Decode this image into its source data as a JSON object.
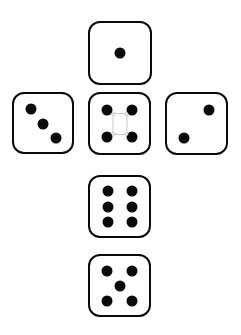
{
  "figure": {
    "background_color": "#ffffff",
    "die_face_color": "#ffffff",
    "die_border_color": "#0a0a0a",
    "pip_color": "#0a0a0a",
    "artifact_color": "#c9c9c9"
  },
  "chart_data": {
    "type": "diagram",
    "layout": "cross",
    "canvas": {
      "width": 241,
      "height": 335
    },
    "dice": [
      {
        "name": "top-die",
        "value": 1,
        "position": "top",
        "x": 88,
        "y": 21,
        "size": 64,
        "pip_layout": [
          "center"
        ],
        "pips": [
          {
            "cx": 50,
            "cy": 50
          }
        ]
      },
      {
        "name": "left-die",
        "value": 3,
        "position": "left",
        "x": 12,
        "y": 92,
        "size": 62,
        "pip_layout": [
          "top-left",
          "center",
          "bottom-right"
        ],
        "pips": [
          {
            "cx": 29,
            "cy": 26
          },
          {
            "cx": 50,
            "cy": 52
          },
          {
            "cx": 73,
            "cy": 76
          }
        ]
      },
      {
        "name": "center-die",
        "value": 4,
        "position": "center",
        "x": 88,
        "y": 92,
        "size": 63,
        "pip_layout": [
          "top-left",
          "top-right",
          "bottom-left",
          "bottom-right"
        ],
        "pips": [
          {
            "cx": 29,
            "cy": 27
          },
          {
            "cx": 72,
            "cy": 27
          },
          {
            "cx": 29,
            "cy": 73
          },
          {
            "cx": 72,
            "cy": 73
          }
        ],
        "artifact": {
          "name": "selection-box",
          "cx": 50,
          "cy": 50,
          "width": 15,
          "height": 22,
          "handles": [
            "top-left",
            "top-right",
            "bottom-left",
            "bottom-right"
          ]
        }
      },
      {
        "name": "right-die",
        "value": 2,
        "position": "right",
        "x": 165,
        "y": 92,
        "size": 63,
        "pip_layout": [
          "top-right",
          "bottom-left"
        ],
        "pips": [
          {
            "cx": 72,
            "cy": 27
          },
          {
            "cx": 28,
            "cy": 74
          }
        ]
      },
      {
        "name": "lower-center-die",
        "value": 6,
        "position": "below-center",
        "x": 88,
        "y": 175,
        "size": 63,
        "pip_layout": [
          "top-left",
          "top-right",
          "mid-left",
          "mid-right",
          "bottom-left",
          "bottom-right"
        ],
        "pips": [
          {
            "cx": 30,
            "cy": 24
          },
          {
            "cx": 71,
            "cy": 24
          },
          {
            "cx": 30,
            "cy": 50
          },
          {
            "cx": 71,
            "cy": 50
          },
          {
            "cx": 30,
            "cy": 77
          },
          {
            "cx": 71,
            "cy": 77
          }
        ]
      },
      {
        "name": "bottom-die",
        "value": 5,
        "position": "bottom",
        "x": 88,
        "y": 254,
        "size": 63,
        "pip_layout": [
          "top-left",
          "top-right",
          "center",
          "bottom-left",
          "bottom-right"
        ],
        "pips": [
          {
            "cx": 29,
            "cy": 25
          },
          {
            "cx": 71,
            "cy": 25
          },
          {
            "cx": 50,
            "cy": 50
          },
          {
            "cx": 29,
            "cy": 76
          },
          {
            "cx": 71,
            "cy": 76
          }
        ]
      }
    ],
    "pip_diameter_px": 11,
    "border_width_px": 2.5,
    "corner_radius_px": 12,
    "total_pips": 21
  }
}
